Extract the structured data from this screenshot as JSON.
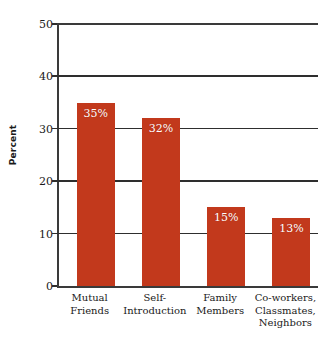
{
  "chart_data": {
    "type": "bar",
    "title": "",
    "subtitle": "",
    "xlabel": "",
    "ylabel": "Percent",
    "ylim": [
      0,
      50
    ],
    "yticks": [
      0,
      10,
      20,
      30,
      40,
      50
    ],
    "ytick_labels": [
      "0",
      "10",
      "20",
      "30",
      "40",
      "50"
    ],
    "grid": "horizontal",
    "legend": "none",
    "bar_color": "#C2391C",
    "value_label_color": "#FFFFFF",
    "axis_color": "#2E2E2E",
    "background_color": "#FFFFFF",
    "categories": [
      "Mutual Friends",
      "Self-Introduction",
      "Family Members",
      "Co-workers, Classmates, Neighbors"
    ],
    "category_label_lines": [
      [
        "Mutual",
        "Friends"
      ],
      [
        "Self-",
        "Introduction"
      ],
      [
        "Family",
        "Members"
      ],
      [
        "Co-workers,",
        "Classmates,",
        "Neighbors"
      ]
    ],
    "values": [
      35,
      32,
      15,
      13
    ],
    "value_labels": [
      "35%",
      "32%",
      "15%",
      "13%"
    ]
  }
}
